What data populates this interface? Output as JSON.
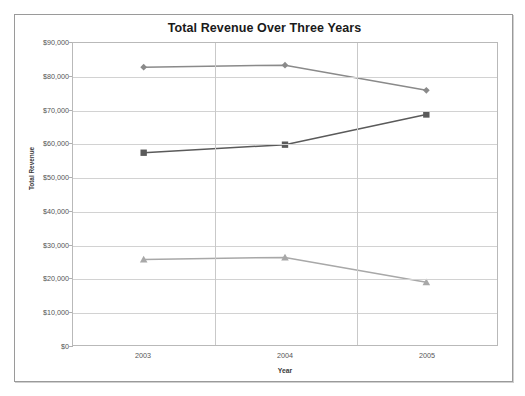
{
  "chart_data": {
    "type": "line",
    "title": "Total Revenue Over Three Years",
    "xlabel": "Year",
    "ylabel": "Total Revenue",
    "categories": [
      "2003",
      "2004",
      "2005"
    ],
    "ylim": [
      0,
      90000
    ],
    "ytick_labels": [
      "$90,000",
      "$80,000",
      "$70,000",
      "$60,000",
      "$50,000",
      "$40,000",
      "$30,000",
      "$20,000",
      "$10,000",
      "$0"
    ],
    "ytick_values": [
      90000,
      80000,
      70000,
      60000,
      50000,
      40000,
      30000,
      20000,
      10000,
      0
    ],
    "grid": true,
    "legend": "none",
    "series": [
      {
        "name": "series-1",
        "marker": "diamond",
        "color": "#8a8a8a",
        "values": [
          82800,
          83400,
          75900
        ]
      },
      {
        "name": "series-2",
        "marker": "square",
        "color": "#5a5a5a",
        "values": [
          57300,
          59700,
          68700
        ]
      },
      {
        "name": "series-3",
        "marker": "triangle",
        "color": "#a8a8a8",
        "values": [
          25500,
          26100,
          18700
        ]
      }
    ]
  }
}
